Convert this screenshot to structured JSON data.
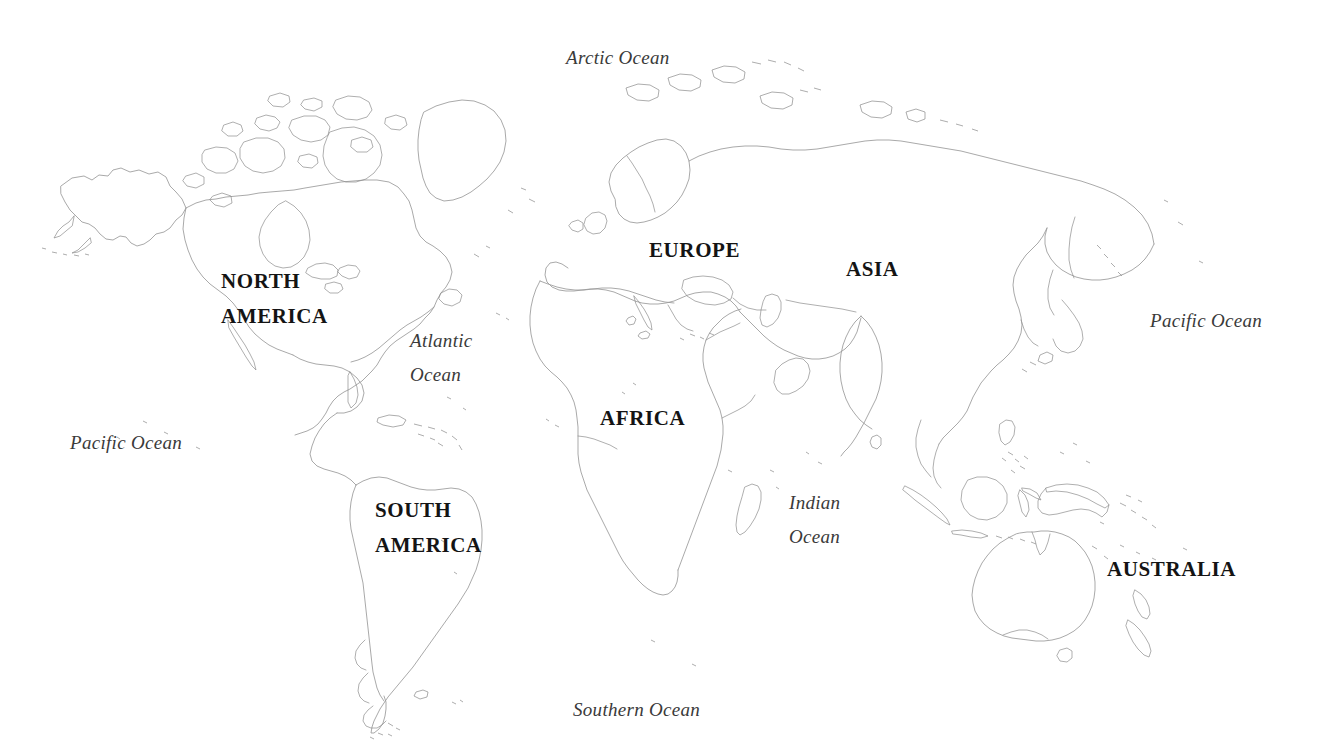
{
  "map": {
    "title": "World Map",
    "projection": "Equirectangular outline world map",
    "background_color": "#ffffff",
    "coastline_color": "#9a9a9a",
    "label_color": "#141414",
    "ocean_label_color": "#3a3a3a",
    "width": 1318,
    "height": 756
  },
  "continent_labels": [
    {
      "id": "north-america",
      "line1": "NORTH",
      "line2": "AMERICA",
      "x": 221,
      "y": 271
    },
    {
      "id": "south-america",
      "line1": "SOUTH",
      "line2": "AMERICA",
      "x": 375,
      "y": 500
    },
    {
      "id": "europe",
      "line1": "EUROPE",
      "line2": "",
      "x": 649,
      "y": 240
    },
    {
      "id": "asia",
      "line1": "ASIA",
      "line2": "",
      "x": 846,
      "y": 259
    },
    {
      "id": "africa",
      "line1": "AFRICA",
      "line2": "",
      "x": 600,
      "y": 408
    },
    {
      "id": "australia",
      "line1": "AUSTRALIA",
      "line2": "",
      "x": 1107,
      "y": 559
    }
  ],
  "ocean_labels": [
    {
      "id": "arctic-ocean",
      "line1": "Arctic Ocean",
      "line2": "",
      "x": 566,
      "y": 48
    },
    {
      "id": "atlantic-ocean",
      "line1": "Atlantic",
      "line2": "Ocean",
      "x": 410,
      "y": 331
    },
    {
      "id": "pacific-ocean-west",
      "line1": "Pacific Ocean",
      "line2": "",
      "x": 70,
      "y": 433
    },
    {
      "id": "pacific-ocean-east",
      "line1": "Pacific Ocean",
      "line2": "",
      "x": 1150,
      "y": 311
    },
    {
      "id": "indian-ocean",
      "line1": "Indian",
      "line2": "Ocean",
      "x": 789,
      "y": 493
    },
    {
      "id": "southern-ocean",
      "line1": "Southern Ocean",
      "line2": "",
      "x": 573,
      "y": 700
    }
  ]
}
